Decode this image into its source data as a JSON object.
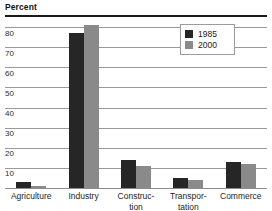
{
  "chart_data": {
    "type": "bar",
    "title": "",
    "ylabel": "Percent",
    "xlabel": "",
    "ylim": [
      0,
      85
    ],
    "yticks": [
      10,
      20,
      30,
      40,
      50,
      60,
      70,
      80
    ],
    "grid": true,
    "legend_position": "top-right",
    "categories": [
      "Agriculture",
      "Industry",
      "Construc-\ntion",
      "Transpor-\ntation",
      "Commerce"
    ],
    "category_labels_flat": [
      "Agriculture",
      "Industry",
      "Construction",
      "Transportation",
      "Commerce"
    ],
    "series": [
      {
        "name": "1985",
        "color": "#262626",
        "values": [
          3,
          77,
          14,
          5,
          13
        ]
      },
      {
        "name": "2000",
        "color": "#8a8a8a",
        "values": [
          1,
          81,
          11,
          4,
          12
        ]
      }
    ]
  },
  "legend": {
    "items": [
      {
        "label": "1985",
        "color": "#262626"
      },
      {
        "label": "2000",
        "color": "#8a8a8a"
      }
    ]
  },
  "colors": {
    "series_1985": "#262626",
    "series_2000": "#8a8a8a",
    "gridline": "#9a9a9a",
    "top_rule": "#1a1a1a",
    "background": "#ffffff"
  }
}
